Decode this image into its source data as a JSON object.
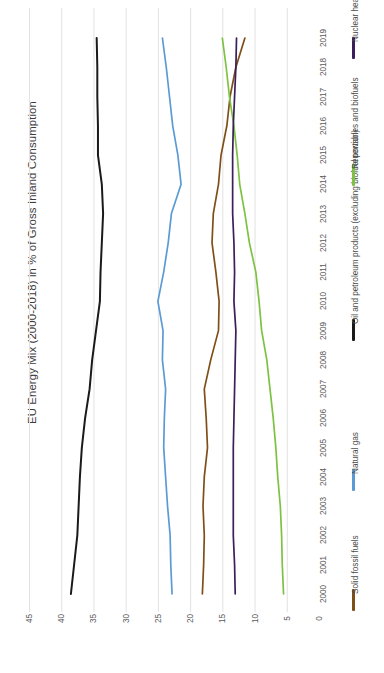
{
  "chart_data": {
    "type": "line",
    "title": "EU Energy Mix (2000-2018) in % of Gross Inland Consumption",
    "xlabel": "",
    "ylabel": "",
    "orientation": "rotated-90",
    "grid": true,
    "legend_position": "right",
    "ylim": [
      0,
      45
    ],
    "yticks": [
      "0",
      "5",
      "10",
      "15",
      "20",
      "25",
      "30",
      "35",
      "40",
      "45"
    ],
    "categories": [
      "2000",
      "2001",
      "2002",
      "2003",
      "2004",
      "2005",
      "2006",
      "2007",
      "2008",
      "2009",
      "2010",
      "2011",
      "2012",
      "2013",
      "2014",
      "2015",
      "2016",
      "2017",
      "2018",
      "2019"
    ],
    "xticks": [
      "2000",
      "2001",
      "2002",
      "2003",
      "2004",
      "2005",
      "2006",
      "2007",
      "2008",
      "2009",
      "2010",
      "2011",
      "2012",
      "2013",
      "2014",
      "2015",
      "2016",
      "2017",
      "2018",
      "2019"
    ],
    "series": [
      {
        "name": "Solid fossil fuels",
        "color": "#7F4F18",
        "values": [
          18.1,
          17.9,
          17.8,
          18.0,
          17.8,
          17.3,
          17.5,
          17.8,
          16.8,
          15.6,
          15.5,
          16.0,
          16.6,
          16.4,
          15.6,
          15.2,
          14.3,
          13.8,
          12.9,
          11.5
        ]
      },
      {
        "name": "Natural gas",
        "color": "#5B9BD5",
        "values": [
          22.8,
          23.0,
          23.1,
          23.5,
          23.8,
          24.1,
          24.0,
          23.8,
          24.3,
          24.2,
          25.0,
          24.1,
          23.4,
          22.9,
          21.4,
          21.9,
          22.7,
          23.2,
          23.7,
          24.3
        ]
      },
      {
        "name": "Oil and petroleum products (excluding biofuel portion)",
        "color": "#1A1A1A",
        "values": [
          38.5,
          38.0,
          37.5,
          37.3,
          37.1,
          36.8,
          36.3,
          35.6,
          35.2,
          34.6,
          34.0,
          33.9,
          33.7,
          33.5,
          33.7,
          34.3,
          34.3,
          34.4,
          34.4,
          34.5
        ]
      },
      {
        "name": "Renewables and biofuels",
        "color": "#7DC242",
        "values": [
          5.5,
          5.7,
          5.8,
          6.0,
          6.4,
          6.7,
          7.1,
          7.6,
          8.1,
          8.9,
          9.3,
          9.8,
          10.8,
          11.5,
          12.3,
          12.7,
          13.2,
          13.9,
          14.4,
          15.0
        ]
      },
      {
        "name": "Nuclear heat",
        "color": "#3B1E5A",
        "values": [
          13.0,
          13.1,
          13.3,
          13.3,
          13.3,
          13.3,
          13.2,
          13.1,
          13.0,
          12.9,
          13.2,
          13.1,
          13.2,
          13.4,
          13.4,
          13.4,
          13.3,
          13.1,
          12.9,
          12.8
        ]
      }
    ]
  },
  "legend": {
    "items": [
      {
        "label": "Solid fossil fuels",
        "color": "#7F4F18"
      },
      {
        "label": "Natural gas",
        "color": "#5B9BD5"
      },
      {
        "label": "Oil and petroleum products (excluding biofuel portion)",
        "color": "#1A1A1A"
      },
      {
        "label": "Renewables and biofuels",
        "color": "#7DC242"
      },
      {
        "label": "Nuclear heat",
        "color": "#3B1E5A"
      }
    ]
  }
}
